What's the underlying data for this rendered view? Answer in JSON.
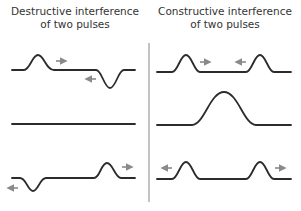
{
  "panels": {
    "left": {
      "title_line1": "Destructive interference",
      "title_line2": "of two pulses"
    },
    "right": {
      "title_line1": "Constructive interference",
      "title_line2": "of two pulses"
    }
  },
  "colors": {
    "wave": "#2b2b2b",
    "arrow": "#8a8a8a",
    "divider": "#9a9a9a",
    "text": "#333333"
  }
}
